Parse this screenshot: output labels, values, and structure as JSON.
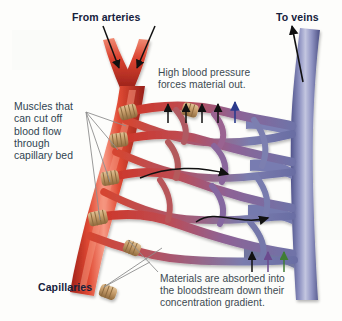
{
  "figure": {
    "background_color": "#fdfdfc"
  },
  "labels": {
    "from_arteries": "From arteries",
    "to_veins": "To veins",
    "capillaries": "Capillaries",
    "high_pressure": "High blood pressure\nforces material out.",
    "muscles": "Muscles that\ncan cut off\nblood flow\nthrough\ncapillary bed",
    "absorption": "Materials are absorbed into\nthe bloodstream down their\nconcentration gradient."
  },
  "colors": {
    "artery_red": "#d8372a",
    "artery_red_dark": "#a8241c",
    "artery_highlight": "#f07a63",
    "vein_blue": "#7b7fb5",
    "vein_blue_dark": "#4e5288",
    "vein_highlight": "#b6b9d8",
    "capillary_mid": "#9a5f86",
    "sphincter_tan": "#c8a171",
    "sphincter_dark": "#9a7446",
    "label_bold": "#15213c",
    "label_note": "#3c4a52",
    "arrow_black": "#111111",
    "arrow_blue": "#2b3a8c",
    "arrow_green": "#3f7d34",
    "arrow_purple": "#6b4a8e",
    "leader_line": "#8a8a8a"
  },
  "arrows": {
    "inflow": [
      {
        "name": "artery-inflow-arrow-left",
        "color": "#111111",
        "direction": "down-right"
      },
      {
        "name": "artery-inflow-arrow-right",
        "color": "#111111",
        "direction": "down-left"
      }
    ],
    "outflow": [
      {
        "name": "vein-outflow-arrow",
        "color": "#111111",
        "direction": "up"
      }
    ],
    "filtration_up": [
      {
        "name": "filtration-arrow-1",
        "color": "#111111"
      },
      {
        "name": "filtration-arrow-2",
        "color": "#111111"
      },
      {
        "name": "filtration-arrow-3",
        "color": "#111111"
      },
      {
        "name": "filtration-arrow-4",
        "color": "#111111"
      },
      {
        "name": "filtration-arrow-5",
        "color": "#2b3a8c"
      }
    ],
    "absorption_up": [
      {
        "name": "absorption-arrow-1",
        "color": "#111111"
      },
      {
        "name": "absorption-arrow-2",
        "color": "#6b4a8e"
      },
      {
        "name": "absorption-arrow-3",
        "color": "#3f7d34"
      }
    ],
    "flow": [
      {
        "name": "blood-flow-arrow-upper",
        "direction": "right"
      },
      {
        "name": "blood-flow-arrow-lower",
        "direction": "right"
      }
    ]
  },
  "sphincters": {
    "count": 7,
    "description": "precapillary sphincter muscle bands"
  }
}
